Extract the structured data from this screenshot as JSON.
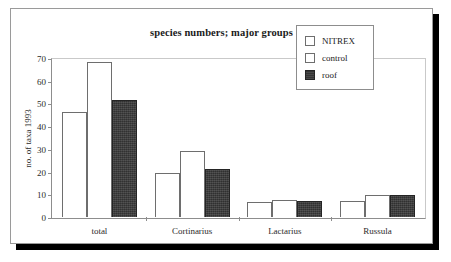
{
  "chart_data": {
    "type": "bar",
    "title": "species numbers; major groups",
    "xlabel": "",
    "ylabel": "no. of taxa 1993",
    "categories": [
      "total",
      "Cortinarius",
      "Lactarius",
      "Russula"
    ],
    "series": [
      {
        "name": "NITREX",
        "values": [
          47,
          19.5,
          6.5,
          7
        ],
        "color": "#ffffff"
      },
      {
        "name": "control",
        "values": [
          69,
          29.5,
          7.5,
          10
        ],
        "color": "#ffffff"
      },
      {
        "name": "roof",
        "values": [
          52,
          21.5,
          7,
          10
        ],
        "color": "#3b3b3b"
      }
    ],
    "ylim": [
      0,
      70
    ],
    "yticks": [
      0,
      10,
      20,
      30,
      40,
      50,
      60,
      70
    ],
    "ytick_labels": [
      "0",
      "10",
      "20",
      "30",
      "40",
      "50",
      "60",
      "70"
    ],
    "grid": false,
    "legend_position": "top-right"
  }
}
